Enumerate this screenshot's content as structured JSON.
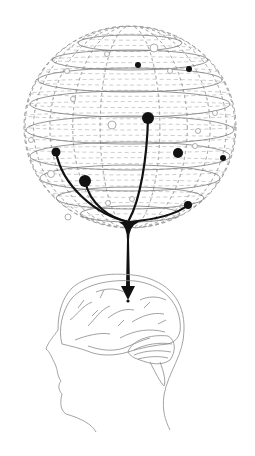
{
  "figure": {
    "description": "Wireframe sphere with scattered points; selected black points connect via curved paths that merge into a single arrow pointing into a human brain shown inside a head profile",
    "colors": {
      "background": "#ffffff",
      "wireframe": "#9a9a9a",
      "ring": "#7a7a7a",
      "active_point": "#111111",
      "inactive_point_stroke": "#9a9a9a",
      "path": "#111111",
      "brain_line": "#8a8a8a"
    },
    "sphere": {
      "cx": 130,
      "cy": 127,
      "rx": 106,
      "ry": 101,
      "rings": [
        {
          "cy": 43,
          "rx": 52,
          "ry": 8
        },
        {
          "cy": 60,
          "rx": 78,
          "ry": 10
        },
        {
          "cy": 80,
          "rx": 92,
          "ry": 12
        },
        {
          "cy": 104,
          "rx": 100,
          "ry": 13
        },
        {
          "cy": 130,
          "rx": 104,
          "ry": 14
        },
        {
          "cy": 156,
          "rx": 100,
          "ry": 14
        },
        {
          "cy": 178,
          "rx": 90,
          "ry": 13
        },
        {
          "cy": 198,
          "rx": 74,
          "ry": 11
        },
        {
          "cy": 214,
          "rx": 50,
          "ry": 8
        }
      ]
    },
    "active_points": [
      {
        "x": 138,
        "y": 65,
        "r": 3
      },
      {
        "x": 189,
        "y": 69,
        "r": 3
      },
      {
        "x": 148,
        "y": 118,
        "r": 6
      },
      {
        "x": 56,
        "y": 152,
        "r": 4.5
      },
      {
        "x": 178,
        "y": 153,
        "r": 5
      },
      {
        "x": 223,
        "y": 158,
        "r": 3
      },
      {
        "x": 85,
        "y": 181,
        "r": 6
      },
      {
        "x": 188,
        "y": 205,
        "r": 4
      }
    ],
    "inactive_points": [
      {
        "x": 154,
        "y": 48,
        "r": 4
      },
      {
        "x": 107,
        "y": 54,
        "r": 2.5
      },
      {
        "x": 67,
        "y": 71,
        "r": 2.5
      },
      {
        "x": 170,
        "y": 71,
        "r": 2.5
      },
      {
        "x": 73,
        "y": 99,
        "r": 2.5
      },
      {
        "x": 215,
        "y": 113,
        "r": 2.5
      },
      {
        "x": 112,
        "y": 125,
        "r": 4
      },
      {
        "x": 198,
        "y": 131,
        "r": 2.5
      },
      {
        "x": 31,
        "y": 140,
        "r": 2.5
      },
      {
        "x": 195,
        "y": 146,
        "r": 2.5
      },
      {
        "x": 51,
        "y": 174,
        "r": 3.5
      },
      {
        "x": 108,
        "y": 203,
        "r": 2.5
      },
      {
        "x": 132,
        "y": 199,
        "r": 2.5
      },
      {
        "x": 68,
        "y": 217,
        "r": 3
      }
    ],
    "convergence": {
      "x": 129,
      "y": 220
    },
    "arrow_tip": {
      "x": 128,
      "y": 300
    },
    "target_point": {
      "x": 128,
      "y": 301
    }
  }
}
